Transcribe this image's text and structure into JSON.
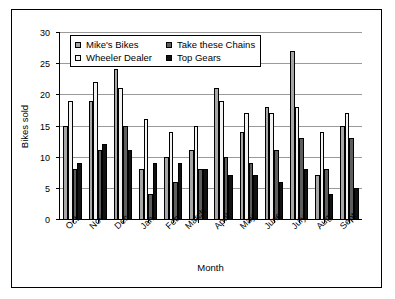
{
  "chart_data": {
    "type": "bar",
    "title": "",
    "xlabel": "Month",
    "ylabel": "Bikes sold",
    "ylim": [
      0,
      30
    ],
    "yticks": [
      0,
      5,
      10,
      15,
      20,
      25,
      30
    ],
    "grid": true,
    "legend_position": "top-left-inside",
    "categories": [
      "Oct",
      "Nov",
      "Dec",
      "Jan",
      "Feb",
      "March",
      "April",
      "May",
      "June",
      "July",
      "Aug",
      "Sept"
    ],
    "series": [
      {
        "name": "Mike's Bikes",
        "color": "#a6a6a6",
        "values": [
          15,
          19,
          24,
          8,
          10,
          11,
          21,
          14,
          18,
          27,
          7,
          15
        ]
      },
      {
        "name": "Wheeler Dealer",
        "color": "#f2f2f2",
        "values": [
          19,
          22,
          21,
          16,
          14,
          15,
          19,
          17,
          17,
          18,
          14,
          17
        ]
      },
      {
        "name": "Take these Chains",
        "color": "#5e5e5e",
        "values": [
          8,
          11,
          15,
          4,
          6,
          8,
          10,
          9,
          11,
          13,
          8,
          13
        ]
      },
      {
        "name": "Top Gears",
        "color": "#111111",
        "values": [
          9,
          12,
          11,
          9,
          9,
          8,
          7,
          7,
          6,
          8,
          4,
          5
        ]
      }
    ],
    "legend_order": [
      "Mike's Bikes",
      "Take these Chains",
      "Wheeler Dealer",
      "Top Gears"
    ]
  }
}
